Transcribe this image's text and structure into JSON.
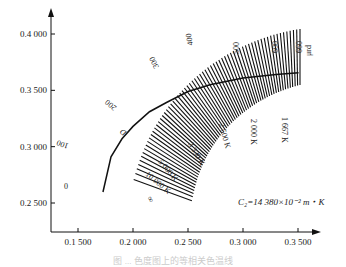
{
  "chart_data": {
    "type": "diagram-lines",
    "title": "",
    "xlabel": "",
    "ylabel": "",
    "xlim": [
      0.125,
      0.355
    ],
    "ylim": [
      0.225,
      0.405
    ],
    "x_ticks": [
      0.15,
      0.2,
      0.25,
      0.3,
      0.35
    ],
    "x_tick_labels": [
      "0.1 500",
      "0.2 000",
      "0.2 500",
      "0.3 000",
      "0.3 500"
    ],
    "y_ticks": [
      0.25,
      0.3,
      0.35,
      0.4
    ],
    "y_tick_labels": [
      "0.2 500",
      "0.3 000",
      "0.3 500",
      "0.4 000"
    ],
    "band": {
      "unit_label": "μrd",
      "scale_labels": [
        "0",
        "100",
        "200",
        "300",
        "400",
        "500",
        "600",
        "660"
      ],
      "scale_values": [
        0,
        100,
        200,
        300,
        400,
        500,
        600,
        660
      ],
      "line_count": 67
    },
    "locus": {
      "name": "Planckian locus",
      "points": [
        [
          0.1727,
          0.2598
        ],
        [
          0.18,
          0.291
        ],
        [
          0.19,
          0.307
        ],
        [
          0.2,
          0.318
        ],
        [
          0.215,
          0.331
        ],
        [
          0.23,
          0.339
        ],
        [
          0.25,
          0.349
        ],
        [
          0.27,
          0.355
        ],
        [
          0.29,
          0.359
        ],
        [
          0.3,
          0.361
        ],
        [
          0.33,
          0.364
        ],
        [
          0.3505,
          0.3655
        ]
      ],
      "label": "D"
    },
    "temperature_labels": [
      "∞",
      "10 000 K",
      "5 000 K",
      "3 330 K",
      "2 500 K",
      "2 000 K",
      "1 667 K"
    ],
    "annotation": "C₂=14 380×10⁻² m・K"
  },
  "caption": "图 ... 色度图上的等相关色温线"
}
